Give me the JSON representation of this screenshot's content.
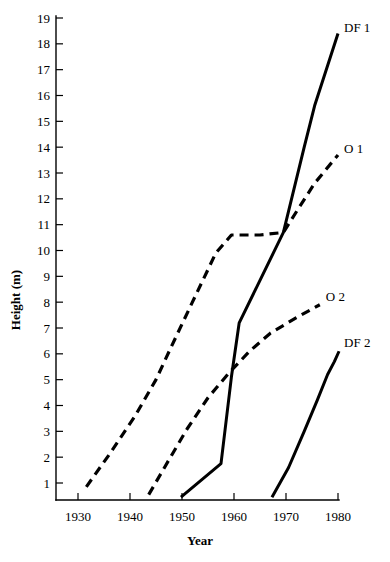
{
  "chart_data": {
    "type": "line",
    "title": "",
    "xlabel": "Year",
    "ylabel": "Height (m)",
    "xlim": [
      1925,
      1980
    ],
    "ylim": [
      0,
      19
    ],
    "grid": false,
    "legend_position": "inline-right-of-curve-ends",
    "xticks": [
      1930,
      1940,
      1950,
      1960,
      1970,
      1980
    ],
    "xtick_labels": [
      "1930",
      "1940",
      "1950",
      "1960",
      "1970",
      "1980"
    ],
    "yticks": [
      1,
      2,
      3,
      4,
      5,
      6,
      7,
      8,
      9,
      10,
      11,
      12,
      13,
      14,
      15,
      16,
      17,
      18,
      19
    ],
    "ytick_labels": [
      "1",
      "2",
      "3",
      "4",
      "5",
      "6",
      "7",
      "8",
      "9",
      "10",
      "11",
      "12",
      "13",
      "14",
      "15",
      "16",
      "17",
      "18",
      "19"
    ],
    "series": [
      {
        "name": "DF 1",
        "label": "DF 1",
        "style": "solid",
        "color": "#000000",
        "points": [
          [
            1949.8,
            0.45
          ],
          [
            1957.5,
            1.75
          ],
          [
            1959.5,
            5.1
          ],
          [
            1961.0,
            7.2
          ],
          [
            1969.5,
            10.7
          ],
          [
            1973.5,
            14.0
          ],
          [
            1975.5,
            15.6
          ],
          [
            1980.0,
            18.4
          ]
        ]
      },
      {
        "name": "O 1",
        "label": "O 1",
        "style": "dashed",
        "color": "#000000",
        "points": [
          [
            1931.6,
            0.85
          ],
          [
            1936.0,
            2.1
          ],
          [
            1941.0,
            3.6
          ],
          [
            1945.0,
            5.0
          ],
          [
            1948.0,
            6.3
          ],
          [
            1952.0,
            8.0
          ],
          [
            1956.5,
            9.9
          ],
          [
            1959.5,
            10.6
          ],
          [
            1965.0,
            10.6
          ],
          [
            1969.5,
            10.7
          ],
          [
            1972.0,
            11.5
          ],
          [
            1975.5,
            12.6
          ],
          [
            1980.0,
            13.7
          ]
        ]
      },
      {
        "name": "O 2",
        "label": "O 2",
        "style": "dashed",
        "color": "#000000",
        "points": [
          [
            1943.6,
            0.55
          ],
          [
            1947.5,
            1.9
          ],
          [
            1951.0,
            3.1
          ],
          [
            1955.0,
            4.3
          ],
          [
            1959.2,
            5.3
          ],
          [
            1963.0,
            6.1
          ],
          [
            1967.0,
            6.8
          ],
          [
            1972.0,
            7.4
          ],
          [
            1976.5,
            7.9
          ]
        ]
      },
      {
        "name": "DF 2",
        "label": "DF 2",
        "style": "solid",
        "color": "#000000",
        "points": [
          [
            1967.3,
            0.45
          ],
          [
            1970.5,
            1.6
          ],
          [
            1973.5,
            3.0
          ],
          [
            1976.0,
            4.2
          ],
          [
            1978.0,
            5.2
          ],
          [
            1979.3,
            5.7
          ],
          [
            1980.2,
            6.1
          ]
        ]
      }
    ]
  },
  "axes": {
    "y_axis_title": "Height (m)",
    "x_axis_title": "Year"
  }
}
